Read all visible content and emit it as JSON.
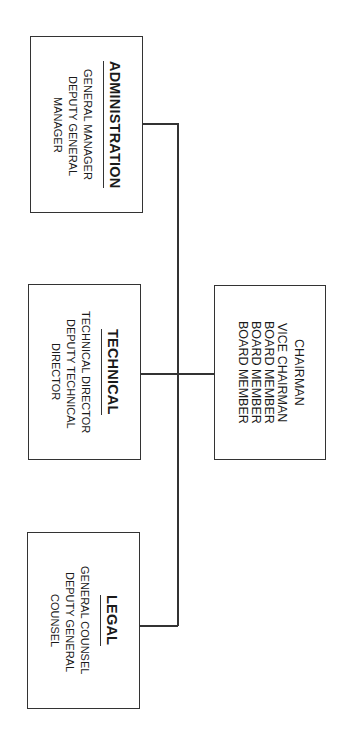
{
  "chart": {
    "orientation": "rotated-90-clockwise",
    "board": {
      "lines": [
        "CHAIRMAN",
        "VICE CHAIRMAN",
        "BOARD MEMBER",
        "BOARD MEMBER",
        "BOARD MEMBER"
      ]
    },
    "departments": [
      {
        "title": "ADMINISTRATION",
        "lines": [
          "GENERAL MANAGER",
          "DEPUTY GENERAL",
          "MANAGER"
        ]
      },
      {
        "title": "TECHNICAL",
        "lines": [
          "TECHNICAL DIRECTOR",
          "DEPUTY TECHNICAL",
          "DIRECTOR"
        ]
      },
      {
        "title": "LEGAL",
        "lines": [
          "GENERAL COUNSEL",
          "DEPUTY GENERAL",
          "COUNSEL"
        ]
      }
    ]
  },
  "colors": {
    "line": "#333333",
    "background": "#ffffff",
    "text": "#1a1a1a"
  }
}
